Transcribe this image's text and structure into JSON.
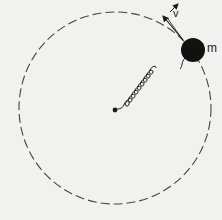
{
  "diagram": {
    "labels": {
      "mass": "m",
      "velocity": "v"
    },
    "colors": {
      "background": "#f1f1ef",
      "ink": "#1a1a1a",
      "orbit": "#444444"
    },
    "geometry": {
      "orbit_center": [
        115,
        108
      ],
      "orbit_radius": 96,
      "mass_center": [
        193,
        50
      ],
      "mass_radius": 12,
      "spring_coils": 10
    }
  }
}
